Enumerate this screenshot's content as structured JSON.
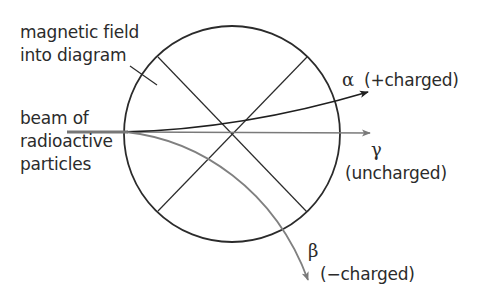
{
  "labels": {
    "field_line1": "magnetic field",
    "field_line2": "into diagram",
    "beam_line1": "beam of",
    "beam_line2": "radioactive",
    "beam_line3": "particles",
    "alpha_symbol": "α",
    "alpha_charge": "(+charged)",
    "gamma_symbol": "γ",
    "gamma_charge": "(uncharged)",
    "beta_symbol": "β",
    "beta_charge": "(−charged)"
  },
  "colors": {
    "line_dark": "#2b2b2b",
    "line_grey": "#777777",
    "alpha_path": "#1f1f1f",
    "gamma_path": "#7a7a7a",
    "beta_path": "#808080"
  },
  "diagram": {
    "field_region": {
      "shape": "circle",
      "center": [
        232,
        134
      ],
      "radius": 108
    },
    "beam_origin": [
      67,
      132
    ],
    "paths": [
      {
        "particle": "alpha",
        "charge": "+",
        "deflection": "up",
        "end": [
          368,
          92
        ]
      },
      {
        "particle": "gamma",
        "charge": "0",
        "deflection": "none",
        "end": [
          370,
          133
        ]
      },
      {
        "particle": "beta",
        "charge": "-",
        "deflection": "down",
        "end": [
          308,
          280
        ]
      }
    ]
  }
}
